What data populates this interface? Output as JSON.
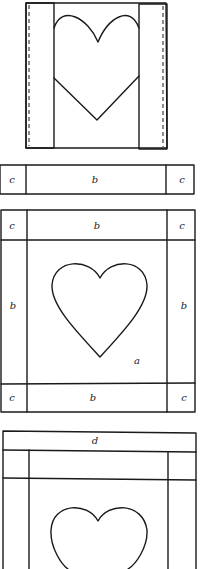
{
  "figures": [
    {
      "id": "step1",
      "description": "Heart block with side strips folded over"
    },
    {
      "id": "step2",
      "description": "Strip c-b-c"
    },
    {
      "id": "step3",
      "description": "Assembled block with borders"
    },
    {
      "id": "step4",
      "description": "Block with d border added"
    }
  ],
  "labels": {
    "strip_left_c": "c",
    "strip_b": "b",
    "strip_right_c": "c",
    "block_top_left_c": "c",
    "block_top_b": "b",
    "block_top_right_c": "c",
    "block_left_b": "b",
    "block_right_b": "b",
    "block_center_a": "a",
    "block_bottom_left_c": "c",
    "block_bottom_b": "b",
    "block_bottom_right_c": "c",
    "final_top_d": "d"
  },
  "colors": {
    "line": "#1a1a1a",
    "background": "#ffffff"
  }
}
